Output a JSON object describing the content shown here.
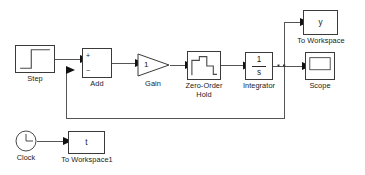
{
  "diagram": {
    "type": "block-diagram",
    "background_color": "#ffffff",
    "line_color": "#555555",
    "block_border_color": "#3a3a3a",
    "text_color": "#1a1a1a"
  },
  "blocks": {
    "step": {
      "label": "Step",
      "icon": "step-signal-icon",
      "x": 15,
      "y": 45,
      "w": 40,
      "h": 28
    },
    "add": {
      "label": "Add",
      "icon": "sum-block-icon",
      "plus_sign": "+",
      "minus_sign": "−",
      "x": 82,
      "y": 48,
      "w": 30,
      "h": 30
    },
    "gain": {
      "label": "Gain",
      "icon": "triangle-gain-icon",
      "value": "1",
      "x": 137,
      "y": 53,
      "w": 33,
      "h": 24
    },
    "zoh": {
      "label": "Zero-Order\nHold",
      "icon": "staircase-icon",
      "x": 187,
      "y": 51,
      "w": 34,
      "h": 29
    },
    "integrator": {
      "label": "Integrator",
      "icon": "integrator-icon",
      "numerator": "1",
      "denominator": "s",
      "x": 245,
      "y": 52,
      "w": 28,
      "h": 28
    },
    "to_workspace": {
      "label": "To Workspace",
      "icon": "to-workspace-icon",
      "variable": "y",
      "x": 303,
      "y": 10,
      "w": 35,
      "h": 25
    },
    "scope": {
      "label": "Scope",
      "icon": "scope-icon",
      "x": 305,
      "y": 52,
      "w": 30,
      "h": 28
    },
    "clock": {
      "label": "Clock",
      "icon": "clock-icon",
      "x": 15,
      "y": 130,
      "w": 22,
      "h": 22
    },
    "to_workspace1": {
      "label": "To Workspace1",
      "icon": "to-workspace-icon",
      "variable": "t",
      "x": 68,
      "y": 131,
      "w": 37,
      "h": 23
    }
  },
  "connections": [
    {
      "name": "step-to-add",
      "from": "step",
      "to": "add"
    },
    {
      "name": "add-to-gain",
      "from": "add",
      "to": "gain"
    },
    {
      "name": "gain-to-zoh",
      "from": "gain",
      "to": "zoh"
    },
    {
      "name": "zoh-to-integrator",
      "from": "zoh",
      "to": "integrator"
    },
    {
      "name": "integrator-to-junction",
      "from": "integrator",
      "to": "junction"
    },
    {
      "name": "junction-to-scope",
      "from": "junction",
      "to": "scope"
    },
    {
      "name": "junction-to-workspace",
      "from": "junction",
      "to": "to_workspace"
    },
    {
      "name": "feedback-to-add",
      "from": "junction",
      "to": "add"
    },
    {
      "name": "clock-to-workspace1",
      "from": "clock",
      "to": "to_workspace1"
    }
  ]
}
